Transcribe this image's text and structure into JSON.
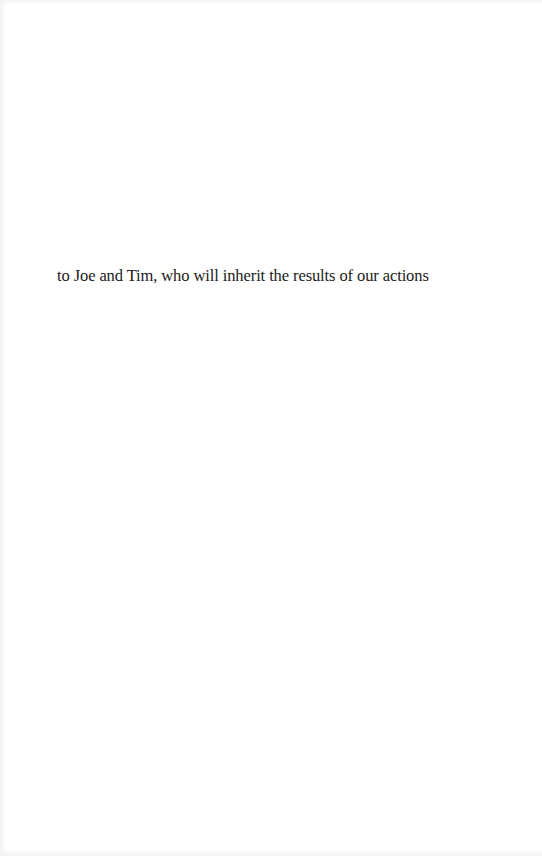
{
  "page": {
    "type": "dedication",
    "dedication_text": "to Joe and Tim, who will inherit the results of our actions"
  },
  "colors": {
    "background": "#ffffff",
    "text": "#1a1a1a"
  }
}
